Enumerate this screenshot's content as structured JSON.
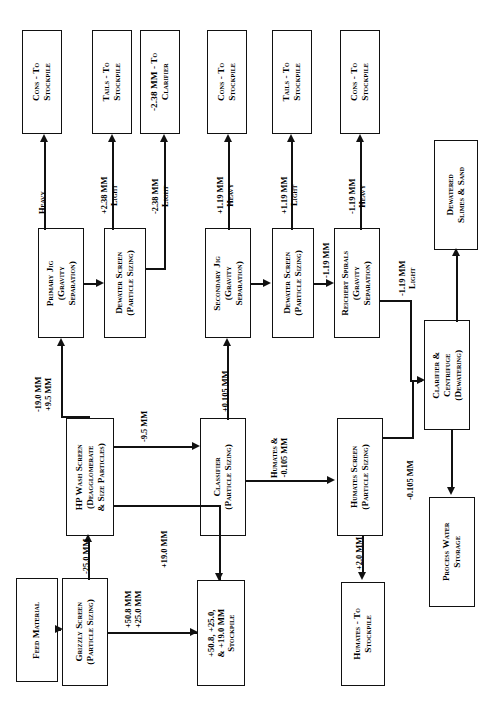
{
  "diagram": {
    "orientation": "rotated-90-ccw",
    "nodes": {
      "feed_material": "Feed Material",
      "grizzly_screen": "Grizzly Screen\n(Particle Sizing)",
      "oversize_stockpile": "+50.8, +25.0,\n& +19.0 MM\nStockpile",
      "hp_wash_screen": "HP Wash Screen\n(Deagglomerate\n& Size Particles)",
      "classifier": "Classifier\n(Particle Sizing)",
      "humates_screen": "Humates Screen\n(Particle Sizing)",
      "humates_stockpile": "Humates - To\nStockpile",
      "primary_jig": "Primary Jig\n(Gravity\nSeparation)",
      "dewater_screen_1": "Dewater Screen\n(Particle Sizing)",
      "secondary_jig": "Secondary Jig\n(Gravity\nSeparation)",
      "dewater_screen_2": "Dewater Screen\n(Particle Sizing)",
      "reichert_spirals": "Reichert Spirals\n(Gravity\nSeparation)",
      "clarifier_centrifuge": "Clarifier &\nCentrifuge\n(Dewatering)",
      "process_water_storage": "Process Water\nStorage",
      "dewatered_slimes": "Dewatered\nSlimes & Sand",
      "cons_stockpile_1": "Cons - To\nStockpile",
      "tails_stockpile_1": "Tails - To\nStockpile",
      "clarifier_feed": "-2.38 MM - To\nClarifier",
      "cons_stockpile_2": "Cons - To\nStockpile",
      "tails_stockpile_2": "Tails - To\nStockpile",
      "cons_stockpile_3": "Cons - To\nStockpile"
    },
    "edges": {
      "grizzly_undersize": "-25.0 MM",
      "grizzly_oversize": "+50.8 MM\n+25.0 MM",
      "hp_oversize": "+19.0 MM",
      "hp_undersize": "-9.5 MM",
      "to_primary_jig": "-19.0 MM\n+9.5 MM",
      "classifier_oversize": "+0.105 MM",
      "classifier_undersize": "Humates &\n-0.105 MM",
      "humates_oversize": "+2.0 MM",
      "humates_undersize": "-0.105 MM",
      "primary_jig_heavy": "Heavy",
      "dewater1_plus": "+2.38 MM\nLight",
      "dewater1_minus": "-2.38 MM\nLight",
      "secondary_jig_heavy": "+1.19 MM\nHeavy",
      "dewater2_light": "+1.19 MM\nLight",
      "dewater2_minus": "-1.19 MM",
      "spirals_heavy": "-1.19 MM\nHeavy",
      "spirals_light": "-1.19 MM\nLight"
    }
  }
}
